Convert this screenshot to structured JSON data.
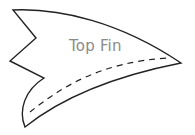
{
  "diagram": {
    "type": "pattern-template",
    "piece": {
      "label": "Top Fin",
      "outline_color": "#222222",
      "label_color": "#8a8a8a",
      "fold_line": {
        "style": "dashed",
        "color": "#222222"
      }
    }
  }
}
